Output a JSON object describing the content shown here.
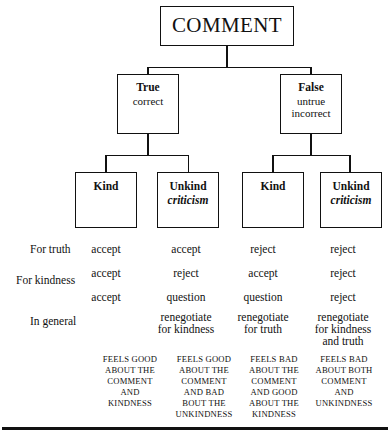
{
  "diagram": {
    "title": "COMMENT",
    "root": {
      "label": "COMMENT"
    },
    "level2": [
      {
        "head": "True",
        "lines": [
          "correct"
        ]
      },
      {
        "head": "False",
        "lines": [
          "untrue",
          "incorrect"
        ]
      }
    ],
    "level3": [
      {
        "head": "Kind",
        "sub": ""
      },
      {
        "head": "Unkind",
        "sub": "criticism"
      },
      {
        "head": "Kind",
        "sub": ""
      },
      {
        "head": "Unkind",
        "sub": "criticism"
      }
    ],
    "matrix": {
      "row_labels": [
        "For truth",
        "For kindness",
        "In general"
      ],
      "rows": [
        {
          "label": "For truth",
          "values": [
            "accept",
            "accept",
            "reject",
            "reject"
          ]
        },
        {
          "label": "For kindness",
          "values": [
            "accept",
            "reject",
            "accept",
            "reject"
          ]
        },
        {
          "label": "",
          "values": [
            "accept",
            "question",
            "question",
            "reject"
          ]
        },
        {
          "label": "In general",
          "values": [
            "",
            "renegotiate\nfor kindness",
            "renegotiate\nfor truth",
            "renegotiate\nfor kindness\nand truth"
          ]
        }
      ]
    },
    "captions": [
      {
        "lines": [
          "FEELS GOOD",
          "ABOUT THE",
          "COMMENT",
          "AND",
          "KINDNESS"
        ]
      },
      {
        "lines": [
          "FEELS GOOD",
          "ABOUT THE",
          "COMMENT",
          "AND BAD",
          "BOUT THE",
          "UNKINDNESS"
        ]
      },
      {
        "lines": [
          "FEELS BAD",
          "ABOUT THE",
          "COMMENT",
          "AND GOOD",
          "ABOUT THE",
          "KINDNESS"
        ]
      },
      {
        "lines": [
          "FEELS BAD",
          "ABOUT BOTH",
          "COMMENT",
          "AND",
          "UNKINDNESS"
        ]
      }
    ],
    "colors": {
      "ink": "#111111",
      "paper": "#ffffff"
    }
  }
}
